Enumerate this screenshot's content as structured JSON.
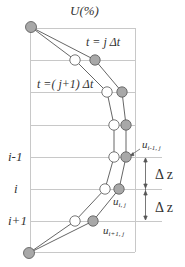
{
  "title": "U(%)",
  "labels": {
    "t_j": "t = j Δt",
    "t_j1": "t =( j+1) Δt",
    "row_im1": "i-1",
    "row_i": "i",
    "row_ip1": "i+1",
    "dz1": "Δ z",
    "dz2": "Δ z",
    "u_im1_j_base": "u",
    "u_im1_j_sub": "i-1, j",
    "u_i_j_base": "u",
    "u_i_j_sub": "i, j",
    "u_ip1_j_base": "u",
    "u_ip1_j_sub": "i+1, j"
  },
  "colors": {
    "grid": "#c8c8c8",
    "curve": "#555555",
    "grey_node": "#a8a8a8",
    "white_node": "#ffffff",
    "node_stroke": "#555555",
    "text": "#333333"
  },
  "grid": {
    "left_x": 30,
    "right_x": 135,
    "rows_y": [
      28,
      60,
      92,
      125,
      157,
      189,
      221,
      252
    ]
  },
  "series": [
    {
      "name": "t = j Δt",
      "node_style": "grey",
      "points": [
        [
          31,
          27
        ],
        [
          95,
          60
        ],
        [
          122,
          92
        ],
        [
          126,
          125
        ],
        [
          126,
          157
        ],
        [
          119,
          189
        ],
        [
          93,
          221
        ],
        [
          29,
          253
        ]
      ]
    },
    {
      "name": "t = (j+1) Δt",
      "node_style": "white",
      "points": [
        [
          31,
          27
        ],
        [
          75,
          60
        ],
        [
          107,
          92
        ],
        [
          114,
          125
        ],
        [
          114,
          157
        ],
        [
          105,
          189
        ],
        [
          75,
          221
        ],
        [
          29,
          253
        ]
      ]
    }
  ]
}
